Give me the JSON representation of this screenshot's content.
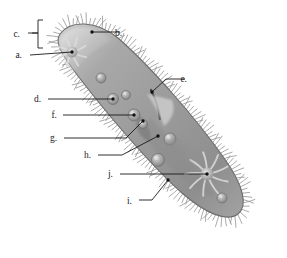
{
  "figure": {
    "title": "",
    "background_color": "#ffffff",
    "body_fill_color": "#9a9a9a",
    "body_edge_color": "#6e6e6e",
    "cilia_color": "#707070",
    "leader_line_color": "#1a1a1a",
    "label_text_color": "#1a1a1a",
    "orientation_note": "cell axis runs diagonally from upper-left to lower-right"
  },
  "labels": [
    {
      "id": "a",
      "text": "a.",
      "text_x": 22,
      "text_y": 58,
      "leader": [
        [
          30,
          55
        ],
        [
          72,
          52
        ]
      ],
      "target": "anterior-contractile-vacuole"
    },
    {
      "id": "b",
      "text": "b.",
      "text_x": 122,
      "text_y": 36,
      "leader": [
        [
          120,
          32
        ],
        [
          92,
          32
        ]
      ],
      "target": "pellicle-surface"
    },
    {
      "id": "c",
      "text": "c.",
      "text_x": 20,
      "text_y": 37,
      "leader": [
        [
          28,
          33
        ],
        [
          38,
          33
        ]
      ],
      "target": "cilia-bracket"
    },
    {
      "id": "d",
      "text": "d.",
      "text_x": 41,
      "text_y": 102,
      "leader": [
        [
          48,
          99
        ],
        [
          113,
          99
        ]
      ],
      "target": "food-vacuole"
    },
    {
      "id": "e",
      "text": "e.",
      "text_x": 187,
      "text_y": 82,
      "leader": [
        [
          185,
          79
        ],
        [
          166,
          79
        ],
        [
          152,
          92
        ]
      ],
      "target": "oral-groove"
    },
    {
      "id": "f",
      "text": "f.",
      "text_x": 57,
      "text_y": 118,
      "leader": [
        [
          63,
          115
        ],
        [
          134,
          115
        ]
      ],
      "target": "food-vacuole-forming"
    },
    {
      "id": "g",
      "text": "g.",
      "text_x": 57,
      "text_y": 141,
      "leader": [
        [
          64,
          138
        ],
        [
          126,
          138
        ],
        [
          143,
          121
        ]
      ],
      "target": "cytopharynx"
    },
    {
      "id": "h",
      "text": "h.",
      "text_x": 91,
      "text_y": 158,
      "leader": [
        [
          98,
          155
        ],
        [
          122,
          155
        ],
        [
          158,
          136
        ]
      ],
      "target": "cytoplasm-endoplasm"
    },
    {
      "id": "i",
      "text": "i.",
      "text_x": 132,
      "text_y": 204,
      "leader": [
        [
          139,
          200
        ],
        [
          152,
          200
        ],
        [
          168,
          180
        ]
      ],
      "target": "cytoproct-anal-pore"
    },
    {
      "id": "j",
      "text": "j.",
      "text_x": 113,
      "text_y": 177,
      "leader": [
        [
          120,
          174
        ],
        [
          207,
          174
        ]
      ],
      "target": "posterior-contractile-vacuole"
    }
  ],
  "bracket": {
    "id": "c-bracket",
    "x": 38,
    "y_top": 20,
    "y_bottom": 48,
    "tick_y": 33,
    "arm_length": 5
  },
  "cell_structures": {
    "body_outline_note": "elongated slipper shape, rounded anterior upper-left, tapered posterior lower-right",
    "cilia_count": 170,
    "food_vacuoles": [
      {
        "cx": 113,
        "cy": 99,
        "r": 5.5
      },
      {
        "cx": 134,
        "cy": 115,
        "r": 6.0
      },
      {
        "cx": 101,
        "cy": 78,
        "r": 5.0
      },
      {
        "cx": 126,
        "cy": 95,
        "r": 4.5
      },
      {
        "cx": 170,
        "cy": 139,
        "r": 6.0
      },
      {
        "cx": 158,
        "cy": 160,
        "r": 6.5
      },
      {
        "cx": 222,
        "cy": 198,
        "r": 5.0
      },
      {
        "cx": 143,
        "cy": 124,
        "r": 4.5
      }
    ],
    "contractile_vacuoles": [
      {
        "cx": 72,
        "cy": 52,
        "r": 3.0,
        "rays": 8,
        "ray_len": 15
      },
      {
        "cx": 207,
        "cy": 174,
        "r": 4.0,
        "rays": 9,
        "ray_len": 22
      }
    ],
    "oral_groove": {
      "start_x": 152,
      "start_y": 92,
      "end_x": 160,
      "end_y": 118
    }
  }
}
